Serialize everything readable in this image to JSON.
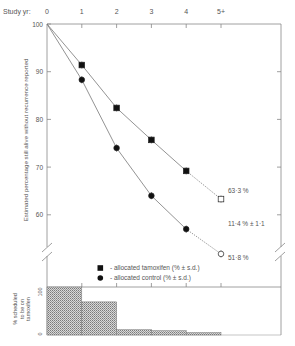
{
  "chart_data": [
    {
      "type": "line",
      "title": "",
      "xlabel": "Study yr:",
      "ylabel": "Estimated percentage still alive without recurrence reported",
      "categories": [
        "0",
        "1",
        "2",
        "3",
        "4",
        "5+"
      ],
      "x": [
        0,
        1,
        2,
        3,
        4,
        5
      ],
      "ylim": [
        52,
        100
      ],
      "yticks": [
        60,
        70,
        80,
        90,
        100
      ],
      "grid": false,
      "axis_break": true,
      "series": [
        {
          "name": "allocated tamoxifen (% ± s.d.)",
          "marker": "square",
          "values": [
            100,
            91.4,
            82.4,
            75.7,
            69.2,
            63.3
          ],
          "dotted_last_segment": true
        },
        {
          "name": "allocated control (% ± s.d.)",
          "marker": "circle",
          "values": [
            100,
            88.3,
            74.0,
            64.0,
            57.0,
            51.8
          ],
          "dotted_last_segment": true
        }
      ],
      "annotations": [
        {
          "text": "63·3 %",
          "x": 5,
          "y": 63.3
        },
        {
          "text": "11·4 % ± 1·1",
          "x": 5,
          "y": 57.5
        },
        {
          "text": "51·8 %",
          "x": 5,
          "y": 51.8
        }
      ],
      "legend": {
        "position": "lower center",
        "entries": [
          {
            "marker": "square",
            "label": "- allocated tamoxifen (% ± s.d.)"
          },
          {
            "marker": "circle",
            "label": "- allocated control (% ± s.d.)"
          }
        ]
      }
    },
    {
      "type": "bar",
      "title": "",
      "xlabel": "",
      "ylabel": "% scheduled to be on tamoxifen",
      "ylabel_lines": [
        "% scheduled",
        "to be on",
        "tamoxifen"
      ],
      "categories": [
        "0-1",
        "1-2",
        "2-3",
        "3-4",
        "4-5"
      ],
      "values": [
        100,
        69,
        11,
        9,
        5
      ],
      "ylim": [
        0,
        100
      ],
      "yticks": [
        "0",
        "100"
      ],
      "hatched": true
    }
  ]
}
